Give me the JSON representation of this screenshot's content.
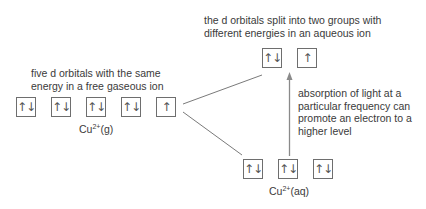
{
  "annotations": {
    "free_ion": [
      "five d orbitals with the same",
      "energy in a free gaseous ion"
    ],
    "aqueous_ion": [
      "the d orbitals split into two groups with",
      "different energies in an aqueous ion"
    ],
    "absorption": [
      "absorption of light at a",
      "particular frequency can",
      "promote an electron to a",
      "higher level"
    ]
  },
  "gaseous_orbitals": [
    "↑↓",
    "↑↓",
    "↑↓",
    "↑↓",
    "↑"
  ],
  "aqueous_upper_orbitals": [
    "↑↓",
    "↑"
  ],
  "aqueous_lower_orbitals": [
    "↑↓",
    "↑↓",
    "↑↓"
  ],
  "labels": {
    "gaseous": {
      "base": "Cu",
      "charge": "2+",
      "state": "(g)"
    },
    "aqueous": {
      "base": "Cu",
      "charge": "2+",
      "state": "(aq)"
    }
  },
  "colors": {
    "line": "#7a7a7a",
    "arrow": "#8a8a8a",
    "box_border": "#6e6e6e"
  }
}
